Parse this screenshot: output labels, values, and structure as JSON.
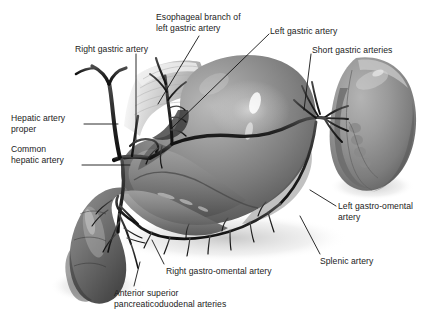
{
  "figure": {
    "background_color": "#ffffff",
    "label_color": "#1b1b1b",
    "leader_line_color": "#141414"
  },
  "labels": [
    {
      "name": "esophageal-branch-of-left-gastric-artery",
      "lines": [
        "Esophageal branch of",
        "left gastric artery"
      ],
      "x": 156,
      "y": 12,
      "align": "left"
    },
    {
      "name": "left-gastric-artery",
      "lines": [
        "Left gastric artery"
      ],
      "x": 270,
      "y": 26,
      "align": "left"
    },
    {
      "name": "right-gastric-artery",
      "lines": [
        "Right gastric artery"
      ],
      "x": 75,
      "y": 44,
      "align": "left"
    },
    {
      "name": "short-gastric-arteries",
      "lines": [
        "Short gastric arteries"
      ],
      "x": 312,
      "y": 45,
      "align": "left"
    },
    {
      "name": "hepatic-artery-proper",
      "lines": [
        "Hepatic artery",
        "proper"
      ],
      "x": 11,
      "y": 113,
      "align": "left"
    },
    {
      "name": "common-hepatic-artery",
      "lines": [
        "Common",
        "hepatic artery"
      ],
      "x": 11,
      "y": 144,
      "align": "left"
    },
    {
      "name": "left-gastro-omental-artery",
      "lines": [
        "Left gastro-omental",
        "artery"
      ],
      "x": 338,
      "y": 201,
      "align": "left"
    },
    {
      "name": "splenic-artery",
      "lines": [
        "Splenic artery"
      ],
      "x": 320,
      "y": 256,
      "align": "left"
    },
    {
      "name": "right-gastro-omental-artery",
      "lines": [
        "Right gastro-omental artery"
      ],
      "x": 166,
      "y": 266,
      "align": "left"
    },
    {
      "name": "anterior-superior-pancreaticoduodenal-arteries",
      "lines": [
        "Anterior superior",
        "pancreaticoduodenal arteries"
      ],
      "x": 114,
      "y": 288,
      "align": "left"
    }
  ],
  "anatomy": {
    "structures": [
      {
        "name": "stomach",
        "label": "Stomach"
      },
      {
        "name": "spleen",
        "label": "Spleen"
      },
      {
        "name": "duodenum",
        "label": "Duodenum"
      },
      {
        "name": "esophagus",
        "label": "Esophagus"
      },
      {
        "name": "arterial-network",
        "label": "Arterial network"
      }
    ]
  }
}
